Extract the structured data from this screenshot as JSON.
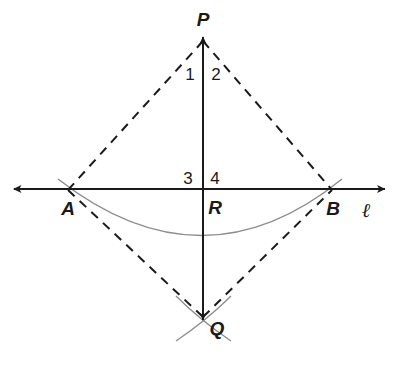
{
  "figure": {
    "background_color": "#ffffff",
    "width": 394,
    "height": 367
  },
  "colors": {
    "solid_line": "#1a1a1a",
    "dashed_line": "#1a1a1a",
    "construction_arc": "#8c8c8c",
    "label_text": "#1a1a1a"
  },
  "points": {
    "P": {
      "label": "P",
      "x": 203,
      "y": 40,
      "label_x": 203,
      "label_y": 19
    },
    "Q": {
      "label": "Q",
      "x": 203,
      "y": 318,
      "label_x": 217,
      "label_y": 328
    },
    "A": {
      "label": "A",
      "x": 68,
      "y": 190,
      "label_x": 68,
      "label_y": 208
    },
    "B": {
      "label": "B",
      "x": 332,
      "y": 190,
      "label_x": 333,
      "label_y": 208
    },
    "R": {
      "label": "R",
      "x": 203,
      "y": 190,
      "label_x": 215,
      "label_y": 207
    }
  },
  "angle_labels": [
    {
      "label": "1",
      "x": 190,
      "y": 74
    },
    {
      "label": "2",
      "x": 216,
      "y": 74
    },
    {
      "label": "3",
      "x": 188,
      "y": 178
    },
    {
      "label": "4",
      "x": 215,
      "y": 178
    }
  ],
  "line_label": {
    "label": "ℓ",
    "x": 366,
    "y": 210
  },
  "segments": {
    "horizontal_line": {
      "name": "line-l",
      "style": "solid",
      "from_x": 14,
      "from_y": 189,
      "to_x": 385,
      "to_y": 189,
      "arrow_start": true,
      "arrow_end": true
    },
    "vertical_line": {
      "name": "segment-PQ",
      "style": "solid",
      "from_x": 203,
      "from_y": 37,
      "to_x": 203,
      "to_y": 320,
      "arrow_start": true,
      "arrow_end": true
    },
    "dashed": [
      {
        "name": "segment-AP",
        "from_x": 68,
        "from_y": 190,
        "to_x": 203,
        "to_y": 41
      },
      {
        "name": "segment-PB",
        "from_x": 203,
        "from_y": 41,
        "to_x": 332,
        "to_y": 190
      },
      {
        "name": "segment-AQ",
        "from_x": 68,
        "from_y": 190,
        "to_x": 203,
        "to_y": 317
      },
      {
        "name": "segment-QB",
        "from_x": 203,
        "from_y": 317,
        "to_x": 332,
        "to_y": 190
      }
    ]
  },
  "arcs": {
    "big_arc": {
      "name": "construction-arc-main",
      "description": "arc from above A sweeping below R to above B",
      "path": "M 58 179 Q 203 292 342 179"
    },
    "cross_arc_left": {
      "name": "construction-arc-left-at-Q",
      "path": "M 176 296 Q 200 320 231 341"
    },
    "cross_arc_right": {
      "name": "construction-arc-right-at-Q",
      "path": "M 231 296 Q 207 320 176 341"
    }
  }
}
